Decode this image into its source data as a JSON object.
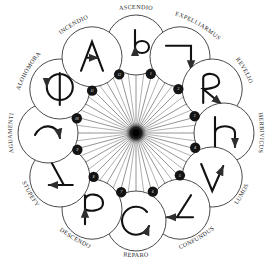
{
  "diagram": {
    "type": "radial-spoke-wheel",
    "center": {
      "x": 136,
      "y": 133,
      "hub_color": "#1a1a1a",
      "label": "hub"
    },
    "geometry": {
      "ring_radius": 88,
      "node_radius": 30,
      "badge_radius": 5.2,
      "spoke_count": 12,
      "arrow_count": 24,
      "line_color": "#3a3a3a",
      "circle_color": "#2b2b2b",
      "badge_fill": "#141414",
      "background": "#ffffff"
    },
    "nodes": [
      {
        "index": 1,
        "label": "ASCENDIO",
        "badge": "1",
        "angle": -90,
        "glyph": "hook-up-b",
        "glyph_name": "wand-motion-ascendio"
      },
      {
        "index": 2,
        "label": "EXPELLIARMUS",
        "badge": "2",
        "angle": -60,
        "glyph": "corner-down",
        "glyph_name": "wand-motion-expelliarmus"
      },
      {
        "index": 3,
        "label": "REVELIO",
        "badge": "3",
        "angle": -30,
        "glyph": "r-loop",
        "glyph_name": "wand-motion-revelio"
      },
      {
        "index": 4,
        "label": "HERBIVICUS",
        "badge": "4",
        "angle": 0,
        "glyph": "h-hook",
        "glyph_name": "wand-motion-herbivicus"
      },
      {
        "index": 5,
        "label": "LUMOS",
        "badge": "5",
        "angle": 30,
        "glyph": "v-down",
        "glyph_name": "wand-motion-lumos"
      },
      {
        "index": 6,
        "label": "CONFUNDUS",
        "badge": "6",
        "angle": 60,
        "glyph": "zigzag-left",
        "glyph_name": "wand-motion-confundus"
      },
      {
        "index": 7,
        "label": "REPARO",
        "badge": "7",
        "angle": 90,
        "glyph": "circle-loop",
        "glyph_name": "wand-motion-reparo"
      },
      {
        "index": 8,
        "label": "DESCENDO",
        "badge": "8",
        "angle": 120,
        "glyph": "p-down",
        "glyph_name": "wand-motion-descendo"
      },
      {
        "index": 9,
        "label": "STUPEFY",
        "badge": "9",
        "angle": 150,
        "glyph": "angle-right",
        "glyph_name": "wand-motion-stupefy"
      },
      {
        "index": 10,
        "label": "AGUAMENTI",
        "badge": "10",
        "angle": 180,
        "glyph": "arc-sweep",
        "glyph_name": "wand-motion-aguamenti"
      },
      {
        "index": 11,
        "label": "ALOHOMORA",
        "badge": "11",
        "angle": -150,
        "glyph": "circle-cross",
        "glyph_name": "wand-motion-alohomora"
      },
      {
        "index": 12,
        "label": "INCENDIO",
        "badge": "12",
        "angle": -120,
        "glyph": "a-peak",
        "glyph_name": "wand-motion-incendio"
      },
      {
        "index": 13,
        "label": "SERPENSORTIA",
        "badge": "13",
        "angle": -105,
        "glyph": "vertical-up",
        "glyph_name": "wand-motion-serpensortia"
      }
    ]
  }
}
